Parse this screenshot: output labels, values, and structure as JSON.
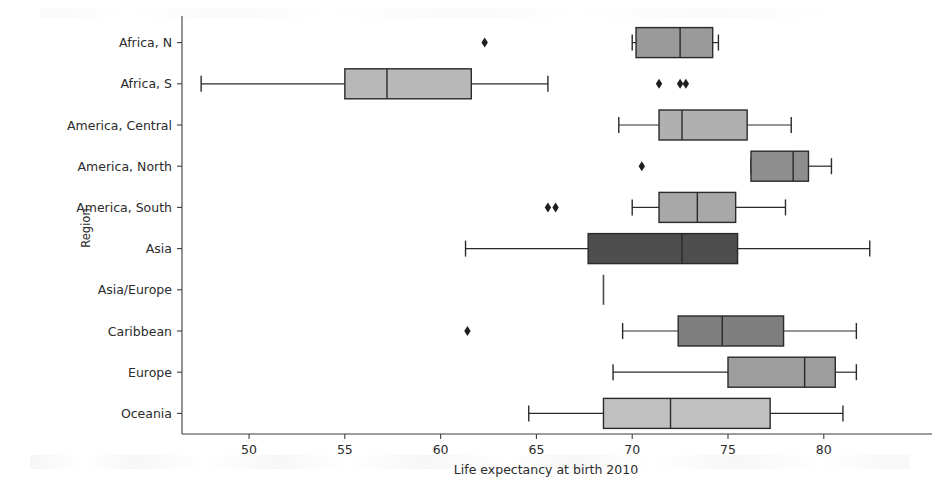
{
  "figure": {
    "background_color": "#ffffff",
    "axis_color": "#3d3d3d",
    "box_edge_color": "#2a2a2a",
    "flier_color": "#1f1f1f"
  },
  "axes": {
    "y_axis_title": "Region",
    "x_axis_title": "Life expectancy at birth 2010",
    "x_ticks": [
      "50",
      "55",
      "60",
      "65",
      "70",
      "75",
      "80"
    ],
    "y_ticks": [
      "Africa, N",
      "Africa, S",
      "America, Central",
      "America, North",
      "America, South",
      "Asia",
      "Asia/Europe",
      "Caribbean",
      "Europe",
      "Oceania"
    ]
  },
  "chart_data": {
    "type": "box",
    "orientation": "horizontal",
    "title": "",
    "xlabel": "Life expectancy at birth 2010",
    "ylabel": "Region",
    "xlim": [
      46.5,
      84.5
    ],
    "xticks": [
      50,
      55,
      60,
      65,
      70,
      75,
      80
    ],
    "grid": false,
    "legend": "none",
    "categories": [
      "Africa, N",
      "Africa, S",
      "America, Central",
      "America, North",
      "America, South",
      "Asia",
      "Asia/Europe",
      "Caribbean",
      "Europe",
      "Oceania"
    ],
    "boxes": [
      {
        "category": "Africa, N",
        "whisker_low": 70.0,
        "q1": 70.2,
        "median": 72.5,
        "q3": 74.2,
        "whisker_high": 74.5,
        "fliers": [
          62.3
        ],
        "fill": "#9a9a9a"
      },
      {
        "category": "Africa, S",
        "whisker_low": 47.5,
        "q1": 55.0,
        "median": 57.2,
        "q3": 61.6,
        "whisker_high": 65.6,
        "fliers": [
          71.4,
          72.5,
          72.8
        ],
        "fill": "#b8b8b8"
      },
      {
        "category": "America, Central",
        "whisker_low": 69.3,
        "q1": 71.4,
        "median": 72.6,
        "q3": 76.0,
        "whisker_high": 78.3,
        "fliers": [],
        "fill": "#b0b0b0"
      },
      {
        "category": "America, North",
        "whisker_low": 76.2,
        "q1": 76.2,
        "median": 78.4,
        "q3": 79.2,
        "whisker_high": 80.4,
        "fliers": [
          70.5
        ],
        "fill": "#8e8e8e"
      },
      {
        "category": "America, South",
        "whisker_low": 70.0,
        "q1": 71.4,
        "median": 73.4,
        "q3": 75.4,
        "whisker_high": 78.0,
        "fliers": [
          65.6,
          66.0
        ],
        "fill": "#a8a8a8"
      },
      {
        "category": "Asia",
        "whisker_low": 61.3,
        "q1": 67.7,
        "median": 72.6,
        "q3": 75.5,
        "whisker_high": 82.4,
        "fliers": [],
        "fill": "#4e4e4e"
      },
      {
        "category": "Asia/Europe",
        "whisker_low": 68.5,
        "q1": 68.5,
        "median": 68.5,
        "q3": 68.5,
        "whisker_high": 68.5,
        "fliers": [],
        "fill": "#6f6f6f",
        "degenerate": true
      },
      {
        "category": "Caribbean",
        "whisker_low": 69.5,
        "q1": 72.4,
        "median": 74.7,
        "q3": 77.9,
        "whisker_high": 81.7,
        "fliers": [
          61.4
        ],
        "fill": "#7f7f7f"
      },
      {
        "category": "Europe",
        "whisker_low": 69.0,
        "q1": 75.0,
        "median": 79.0,
        "q3": 80.6,
        "whisker_high": 81.7,
        "fliers": [],
        "fill": "#9e9e9e"
      },
      {
        "category": "Oceania",
        "whisker_low": 64.6,
        "q1": 68.5,
        "median": 72.0,
        "q3": 77.2,
        "whisker_high": 81.0,
        "fliers": [],
        "fill": "#c0c0c0"
      }
    ]
  }
}
